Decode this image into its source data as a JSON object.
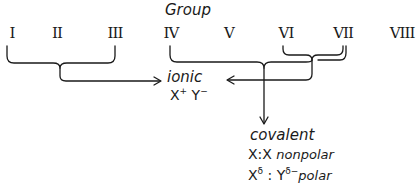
{
  "title": "Group",
  "groups": [
    "I",
    "II",
    "III",
    "IV",
    "V",
    "VI",
    "VII",
    "VIII"
  ],
  "ionic": {
    "label": "ionic",
    "formula_x": "X",
    "formula_x_charge": "+",
    "formula_y": "Y",
    "formula_y_charge": "−"
  },
  "covalent": {
    "label": "covalent",
    "nonpolar": {
      "formula": "X:X",
      "label": "nonpolar"
    },
    "polar": {
      "x": "X",
      "x_charge": "δ",
      "sep": " : ",
      "y": "Y",
      "y_charge": "δ−",
      "label": "polar"
    }
  },
  "connections": [
    {
      "from": [
        "I",
        "II",
        "III"
      ],
      "to": "ionic"
    },
    {
      "from": [
        "VI",
        "VII"
      ],
      "to": "ionic"
    },
    {
      "from": [
        "IV",
        "VI",
        "VII"
      ],
      "to": "covalent"
    }
  ],
  "colors": {
    "ink": "#1a1a1a",
    "background": "#ffffff"
  }
}
